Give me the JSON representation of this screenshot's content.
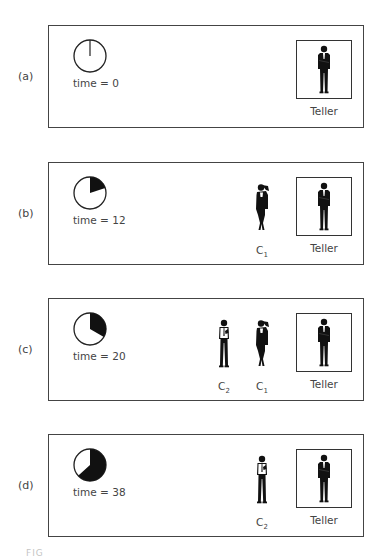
{
  "figure": {
    "caption_fragment": "FIG",
    "clock_period": 60,
    "colors": {
      "frame": "#444444",
      "ink": "#111111",
      "text": "#444444"
    },
    "panels": [
      {
        "id": "a",
        "label": "(a)",
        "time_label": "time = 0",
        "time": 0,
        "server_label": "Teller",
        "queue": []
      },
      {
        "id": "b",
        "label": "(b)",
        "time_label": "time = 12",
        "time": 12,
        "server_label": "Teller",
        "queue": [
          {
            "name": "C",
            "sub": "1",
            "icon": "woman-figure-icon"
          }
        ]
      },
      {
        "id": "c",
        "label": "(c)",
        "time_label": "time = 20",
        "time": 20,
        "server_label": "Teller",
        "queue": [
          {
            "name": "C",
            "sub": "2",
            "icon": "man-figure-icon"
          },
          {
            "name": "C",
            "sub": "1",
            "icon": "woman-figure-icon"
          }
        ]
      },
      {
        "id": "d",
        "label": "(d)",
        "time_label": "time = 38",
        "time": 38,
        "server_label": "Teller",
        "queue": [
          {
            "name": "C",
            "sub": "2",
            "icon": "man-figure-icon"
          }
        ]
      }
    ]
  }
}
